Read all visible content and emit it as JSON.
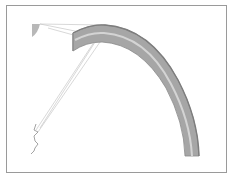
{
  "figure": {
    "colors": {
      "frame": "#9a9a9a",
      "arc_dark": "#8a8a8a",
      "arc_mid": "#a9a9a9",
      "arc_light": "#d0d0d0",
      "lines": "#b5b5b5",
      "crack": "#8c8c8c",
      "sector": "#b8b8b8"
    }
  }
}
